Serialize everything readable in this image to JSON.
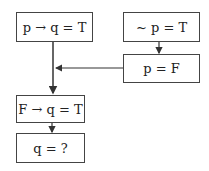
{
  "diagram": {
    "type": "flowchart",
    "nodes": [
      {
        "id": "premise1",
        "label": "p → q = T"
      },
      {
        "id": "premise2",
        "label": "~ p = T"
      },
      {
        "id": "derived_p",
        "label": "p = F"
      },
      {
        "id": "substituted",
        "label": "F → q = T"
      },
      {
        "id": "question",
        "label": "q = ?"
      }
    ],
    "edges": [
      {
        "from": "premise2",
        "to": "derived_p"
      },
      {
        "from": "premise1",
        "to": "substituted"
      },
      {
        "from": "derived_p",
        "to": "substituted",
        "joins": "premise1-line"
      },
      {
        "from": "substituted",
        "to": "question"
      }
    ]
  }
}
